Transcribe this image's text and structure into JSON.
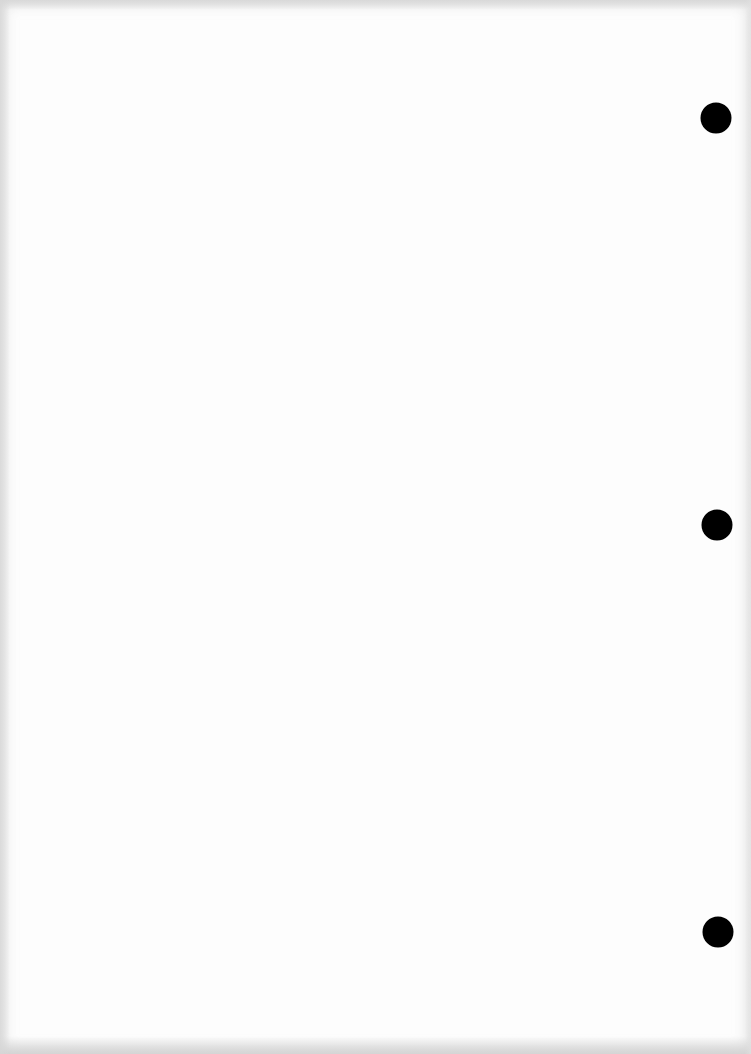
{
  "document": {
    "type": "blank scanned page",
    "text": "",
    "background_color": "#fdfdfd",
    "hole_color": "#000000"
  },
  "punch_holes": [
    {
      "cx": 716,
      "cy": 118,
      "r": 15
    },
    {
      "cx": 717,
      "cy": 525,
      "r": 15
    },
    {
      "cx": 718,
      "cy": 932,
      "r": 15
    }
  ]
}
